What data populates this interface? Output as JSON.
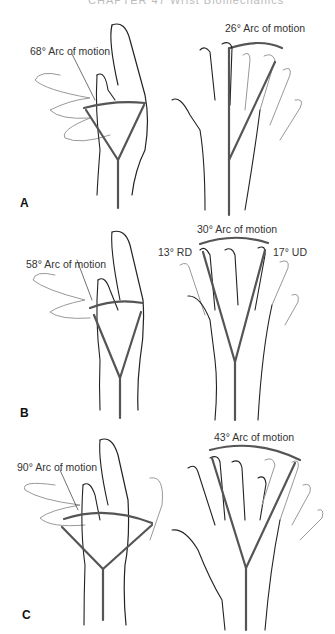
{
  "running_head": "CHAPTER 47  Wrist Biomechanics",
  "panels": [
    {
      "id": "A",
      "left_label": "68° Arc of motion",
      "right_label": "26° Arc of motion"
    },
    {
      "id": "B",
      "left_label": "58° Arc of motion",
      "right_label": "30° Arc of motion",
      "rd_label": "13° RD",
      "ud_label": "17° UD"
    },
    {
      "id": "C",
      "left_label": "90° Arc of motion",
      "right_label": "43° Arc of motion"
    }
  ],
  "colors": {
    "line": "#555555",
    "outline": "#222222",
    "faint": "#999999"
  }
}
